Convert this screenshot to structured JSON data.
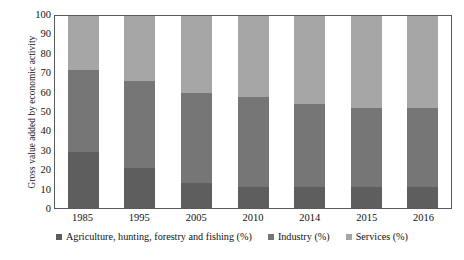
{
  "chart_data": {
    "type": "bar",
    "subtype": "stacked-100-percent",
    "title": "",
    "xlabel": "",
    "ylabel": "Gross value added by economic activity",
    "ylim": [
      0,
      100
    ],
    "yticks": [
      100,
      90,
      80,
      70,
      60,
      50,
      40,
      30,
      20,
      10,
      0
    ],
    "grid": false,
    "legend_position": "bottom",
    "categories": [
      "1985",
      "1995",
      "2005",
      "2010",
      "2014",
      "2015",
      "2016"
    ],
    "series": [
      {
        "name": "Agriculture, hunting, forestry and fishing (%)",
        "color": "#5e5e5e",
        "values": [
          29,
          21,
          13,
          11,
          11,
          11,
          11
        ]
      },
      {
        "name": "Industry (%)",
        "color": "#767676",
        "values": [
          43,
          45,
          47,
          47,
          43,
          41,
          41
        ]
      },
      {
        "name": "Services (%)",
        "color": "#a6a6a6",
        "values": [
          28,
          34,
          40,
          42,
          46,
          48,
          48
        ]
      }
    ]
  },
  "legend": {
    "items": [
      {
        "label": "Agriculture, hunting, forestry and fishing (%)",
        "color": "#5e5e5e"
      },
      {
        "label": "Industry (%)",
        "color": "#767676"
      },
      {
        "label": "Services (%)",
        "color": "#a6a6a6"
      }
    ]
  },
  "colors": {
    "agriculture": "#5e5e5e",
    "industry": "#767676",
    "services": "#a6a6a6",
    "axis": "#5a5a5a",
    "text": "#111111",
    "background": "#ffffff"
  }
}
